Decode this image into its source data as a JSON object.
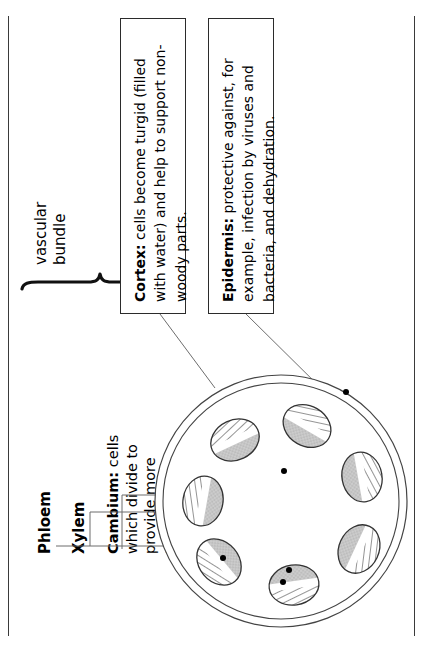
{
  "diagram": {
    "brace_label": {
      "line1": "vascular",
      "line2": "bundle"
    },
    "labels": [
      {
        "id": "phloem",
        "text": "Phloem"
      },
      {
        "id": "xylem",
        "text": "Xylem"
      }
    ],
    "cambium": {
      "term": "Cambium:",
      "body": " cells\nwhich divide to\nprovide more\nphloem and\nxylem"
    },
    "callouts": [
      {
        "id": "cortex",
        "term": "Cortex:",
        "body": " cells become turgid (filled with water) and help to support non-woody parts."
      },
      {
        "id": "epidermis",
        "term": "Epidermis:",
        "body": " protective against, for example, infection by viruses and bacteria, and dehydration."
      }
    ]
  },
  "colors": {
    "ink": "#000000",
    "frame": "#3a3a3a",
    "leader": "#6d6d6d",
    "box_border": "#2b2b2b",
    "bundle_stroke": "#333333",
    "bundle_fill_gray": "#c9c9c9",
    "bundle_fill_white": "#ffffff",
    "stem_stroke": "#444444",
    "marker_dot": "#000000"
  },
  "bundle_count": 7
}
